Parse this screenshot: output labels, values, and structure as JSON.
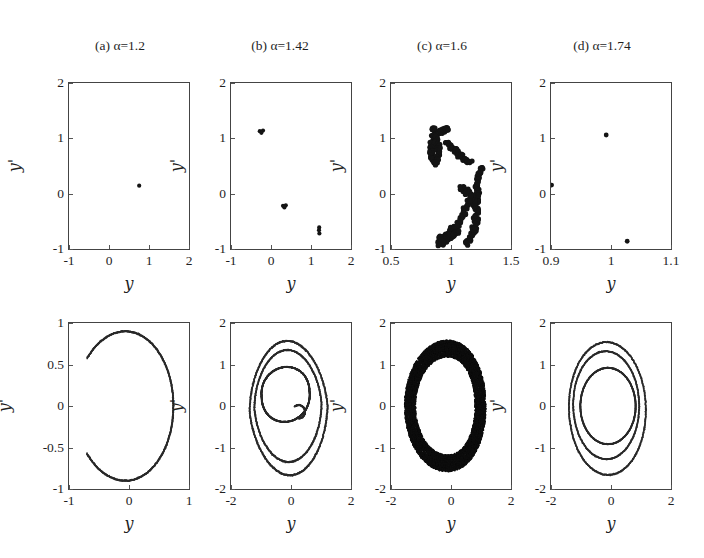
{
  "figure": {
    "width": 704,
    "height": 558,
    "background": "#ffffff",
    "ink": "#1a1a1a",
    "rows": 2,
    "cols": 4
  },
  "column_titles": [
    {
      "label": "(a) α=1.2",
      "prefix": "(a) ",
      "alpha": "α",
      "value": "=1.2"
    },
    {
      "label": "(b) α=1.42",
      "prefix": "(b) ",
      "alpha": "α",
      "value": "=1.42"
    },
    {
      "label": "(c) α=1.6",
      "prefix": "(c) ",
      "alpha": "α",
      "value": "=1.6"
    },
    {
      "label": "(d) α=1.74",
      "prefix": "(d) ",
      "alpha": "α",
      "value": "=1.74"
    }
  ],
  "chart_data": [
    {
      "id": "poincare-a",
      "panel": "(a) α=1.2",
      "row": "top",
      "type": "scatter",
      "title": "",
      "xlabel": "y",
      "ylabel": "y'",
      "xlim": [
        -1,
        2
      ],
      "ylim": [
        -1,
        2
      ],
      "xticks": [
        -1,
        0,
        1,
        2
      ],
      "xticklabels": [
        "-1",
        "0",
        "1",
        "2"
      ],
      "yticks": [
        -1,
        0,
        1,
        2
      ],
      "yticklabels": [
        "-1",
        "0",
        "1",
        "2"
      ],
      "grid": false,
      "legend": "none",
      "marker_size": 2.1,
      "color": "#141414",
      "annotation": "period-1 fixed point",
      "points": [
        [
          0.755,
          0.145
        ]
      ]
    },
    {
      "id": "poincare-b",
      "panel": "(b) α=1.42",
      "row": "top",
      "type": "scatter",
      "title": "",
      "xlabel": "y",
      "ylabel": "y'",
      "xlim": [
        -1,
        2
      ],
      "ylim": [
        -1,
        2
      ],
      "xticks": [
        -1,
        0,
        1,
        2
      ],
      "xticklabels": [
        "-1",
        "0",
        "1",
        "2"
      ],
      "yticks": [
        -1,
        0,
        1,
        2
      ],
      "yticklabels": [
        "-1",
        "0",
        "1",
        "2"
      ],
      "grid": false,
      "legend": "none",
      "marker_size": 2.1,
      "color": "#141414",
      "annotation": "period-6 (three doubled clusters)",
      "points": [
        [
          -0.28,
          1.13
        ],
        [
          -0.2,
          1.14
        ],
        [
          -0.24,
          1.1
        ],
        [
          0.3,
          -0.22
        ],
        [
          0.37,
          -0.21
        ],
        [
          0.335,
          -0.25
        ],
        [
          1.2,
          -0.66
        ],
        [
          1.21,
          -0.72
        ],
        [
          1.205,
          -0.61
        ]
      ]
    },
    {
      "id": "poincare-c",
      "panel": "(c) α=1.6",
      "row": "top",
      "type": "scatter",
      "title": "",
      "xlabel": "y",
      "ylabel": "y'",
      "xlim": [
        0.5,
        1.5
      ],
      "ylim": [
        -1,
        2
      ],
      "xticks": [
        0.5,
        1,
        1.5
      ],
      "xticklabels": [
        "0.5",
        "1",
        "1.5"
      ],
      "yticks": [
        -1,
        0,
        1,
        2
      ],
      "yticklabels": [
        "-1",
        "0",
        "1",
        "2"
      ],
      "grid": false,
      "legend": "none",
      "marker_size": 2.6,
      "color": "#141414",
      "annotation": "chaotic strange attractor (fractal S/C shape)",
      "point_count": 430,
      "shape": "strange-attractor"
    },
    {
      "id": "poincare-d",
      "panel": "(d) α=1.74",
      "row": "top",
      "type": "scatter",
      "title": "",
      "xlabel": "y",
      "ylabel": "y'",
      "xlim": [
        0.9,
        1.1
      ],
      "ylim": [
        -1,
        2
      ],
      "xticks": [
        0.9,
        1,
        1.1
      ],
      "xticklabels": [
        "0.9",
        "1",
        "1.1"
      ],
      "yticks": [
        -1,
        0,
        1,
        2
      ],
      "yticklabels": [
        "-1",
        "0",
        "1",
        "2"
      ],
      "grid": false,
      "legend": "none",
      "marker_size": 2.4,
      "color": "#141414",
      "annotation": "period-3 orbit",
      "points": [
        [
          0.992,
          1.06
        ],
        [
          0.901,
          0.155
        ],
        [
          1.027,
          -0.86
        ]
      ]
    },
    {
      "id": "phase-a",
      "panel": "(a) α=1.2",
      "row": "bottom",
      "type": "scatter",
      "title": "",
      "xlabel": "y",
      "ylabel": "y'",
      "xlim": [
        -1,
        1
      ],
      "ylim": [
        -1,
        1
      ],
      "xticks": [
        -1,
        0,
        1
      ],
      "xticklabels": [
        "-1",
        "0",
        "1"
      ],
      "yticks": [
        -1,
        -0.5,
        0,
        0.5,
        1
      ],
      "yticklabels": [
        "-1",
        "-0.5",
        "0",
        "0.5",
        "1"
      ],
      "grid": false,
      "legend": "none",
      "marker_size": 0.9,
      "color": "#2a2a2a",
      "annotation": "single limit-cycle (open C shaped loop)",
      "shape": "limit-cycle-1"
    },
    {
      "id": "phase-b",
      "panel": "(b) α=1.42",
      "row": "bottom",
      "type": "scatter",
      "title": "",
      "xlabel": "y",
      "ylabel": "y'",
      "xlim": [
        -2,
        2
      ],
      "ylim": [
        -2,
        2
      ],
      "xticks": [
        -2,
        0,
        2
      ],
      "xticklabels": [
        "-2",
        "0",
        "2"
      ],
      "yticks": [
        -2,
        -1,
        0,
        1,
        2
      ],
      "yticklabels": [
        "-2",
        "-1",
        "0",
        "1",
        "2"
      ],
      "grid": false,
      "legend": "none",
      "marker_size": 0.85,
      "color": "#2a2a2a",
      "annotation": "multi-loop quasi-periodic orbit (inner dark loop + outer loops)",
      "shape": "multi-loop"
    },
    {
      "id": "phase-c",
      "panel": "(c) α=1.6",
      "row": "bottom",
      "type": "scatter",
      "title": "",
      "xlabel": "y",
      "ylabel": "y'",
      "xlim": [
        -2,
        2
      ],
      "ylim": [
        -2,
        2
      ],
      "xticks": [
        -2,
        0,
        2
      ],
      "xticklabels": [
        "-2",
        "0",
        "2"
      ],
      "yticks": [
        -2,
        -1,
        0,
        1,
        2
      ],
      "yticklabels": [
        "-2",
        "-1",
        "0",
        "1",
        "2"
      ],
      "grid": false,
      "legend": "none",
      "marker_size": 1.0,
      "color": "#0d0d0d",
      "annotation": "dense chaotic band filling an annulus",
      "shape": "dense-annulus"
    },
    {
      "id": "phase-d",
      "panel": "(d) α=1.74",
      "row": "bottom",
      "type": "scatter",
      "title": "",
      "xlabel": "y",
      "ylabel": "y'",
      "xlim": [
        -2,
        2
      ],
      "ylim": [
        -2,
        2
      ],
      "xticks": [
        -2,
        0,
        2
      ],
      "xticklabels": [
        "-2",
        "0",
        "2"
      ],
      "yticks": [
        -2,
        -1,
        0,
        1,
        2
      ],
      "yticklabels": [
        "-2",
        "-1",
        "0",
        "1",
        "2"
      ],
      "grid": false,
      "legend": "none",
      "marker_size": 0.85,
      "color": "#2a2a2a",
      "annotation": "period-3 orbit: three nested closed loops",
      "shape": "three-loops"
    }
  ]
}
